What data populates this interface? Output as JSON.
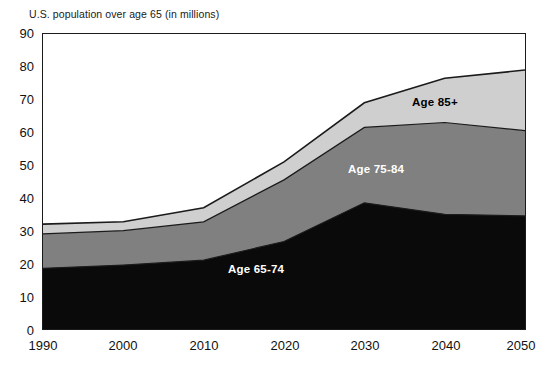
{
  "caption": "U.S. population over age 65 (in millions)",
  "colors": {
    "age_65_74": "#0a0a0a",
    "age_75_84": "#808080",
    "age_85_plus": "#cfcfcf",
    "outline": "#1b1b1b",
    "background": "#ffffff"
  },
  "labels": {
    "age_65_74": "Age 65-74",
    "age_75_84": "Age 75-84",
    "age_85_plus": "Age 85+"
  },
  "axis": {
    "y_ticks": [
      "90",
      "80",
      "70",
      "60",
      "50",
      "40",
      "30",
      "20",
      "10",
      "0"
    ],
    "x_ticks": [
      "1990",
      "2000",
      "2010",
      "2020",
      "2030",
      "2040",
      "2050"
    ]
  },
  "chart_data": {
    "type": "area",
    "title": "",
    "subtitle": "",
    "xlabel": "",
    "ylabel": "U.S. population over age 65 (in millions)",
    "stacked": true,
    "grid": false,
    "legend": "inline-annotations",
    "xlim": [
      1990,
      2050
    ],
    "ylim": [
      0,
      90
    ],
    "ytick_step": 10,
    "xtick_step": 10,
    "x": [
      1990,
      2000,
      2010,
      2020,
      2030,
      2040,
      2050
    ],
    "categories": [
      "1990",
      "2000",
      "2010",
      "2020",
      "2030",
      "2040",
      "2050"
    ],
    "series": [
      {
        "name": "Age 65-74",
        "values": [
          18.5,
          19.5,
          21.0,
          26.7,
          38.5,
          35.0,
          34.5
        ]
      },
      {
        "name": "Age 75-84",
        "values": [
          10.5,
          10.5,
          11.7,
          18.8,
          23.0,
          28.0,
          26.0
        ]
      },
      {
        "name": "Age 85+",
        "values": [
          3.0,
          2.7,
          4.3,
          5.5,
          7.5,
          13.5,
          18.5
        ]
      }
    ],
    "cumulative_totals": [
      32.0,
      32.7,
      37.0,
      51.0,
      69.0,
      76.5,
      79.0
    ],
    "annotations": [
      {
        "text": "Age 65-74",
        "x": 2020,
        "y": 13
      },
      {
        "text": "Age 75-84",
        "x": 2015,
        "y": 47
      },
      {
        "text": "Age 85+",
        "x": 2035,
        "y": 71
      }
    ]
  }
}
